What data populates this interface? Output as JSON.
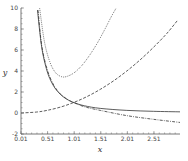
{
  "chart_data": {
    "type": "line",
    "title": "",
    "xlabel": "x",
    "ylabel": "y",
    "xlim": [
      0.01,
      3.0
    ],
    "ylim": [
      -2,
      10
    ],
    "xticks": [
      0.01,
      0.51,
      1.01,
      1.51,
      2.01,
      2.51
    ],
    "xtick_labels": [
      "0.01",
      "0.51",
      "1.01",
      "1.51",
      "2.01",
      "2.51"
    ],
    "yticks": [
      -2,
      0,
      2,
      4,
      6,
      8,
      10
    ],
    "ytick_labels": [
      "-2",
      "0",
      "2",
      "4",
      "6",
      "8",
      "10"
    ],
    "grid": false,
    "legend": null,
    "series": [
      {
        "name": "solid",
        "style": "solid",
        "x": [
          0.32,
          0.4,
          0.5,
          0.6,
          0.7,
          0.8,
          0.9,
          1.0,
          1.2,
          1.5,
          2.0,
          2.5,
          3.0
        ],
        "y": [
          9.8,
          6.25,
          4.0,
          2.78,
          2.04,
          1.56,
          1.23,
          1.0,
          0.69,
          0.44,
          0.25,
          0.16,
          0.11
        ]
      },
      {
        "name": "dash-dot",
        "style": "dashdot",
        "x": [
          0.33,
          0.4,
          0.5,
          0.6,
          0.7,
          0.8,
          0.9,
          1.0,
          1.2,
          1.5,
          2.0,
          2.5,
          3.0
        ],
        "y": [
          9.8,
          6.4,
          4.2,
          2.9,
          2.1,
          1.6,
          1.25,
          1.0,
          0.6,
          0.25,
          -0.25,
          -0.6,
          -0.9
        ]
      },
      {
        "name": "dashed",
        "style": "dashed",
        "x": [
          0.01,
          0.3,
          0.5,
          0.75,
          1.0,
          1.25,
          1.5,
          1.75,
          2.0,
          2.25,
          2.5,
          2.75,
          2.95
        ],
        "y": [
          0.0,
          0.09,
          0.25,
          0.56,
          1.0,
          1.56,
          2.25,
          3.06,
          4.0,
          5.06,
          6.25,
          7.56,
          8.8
        ]
      },
      {
        "name": "dotted",
        "style": "dotted",
        "x": [
          0.36,
          0.45,
          0.55,
          0.65,
          0.75,
          0.85,
          1.0,
          1.15,
          1.3,
          1.45,
          1.6,
          1.7,
          1.8
        ],
        "y": [
          10.0,
          6.8,
          4.9,
          3.9,
          3.5,
          3.45,
          3.8,
          4.5,
          5.5,
          6.7,
          8.1,
          9.1,
          10.0
        ]
      }
    ]
  }
}
